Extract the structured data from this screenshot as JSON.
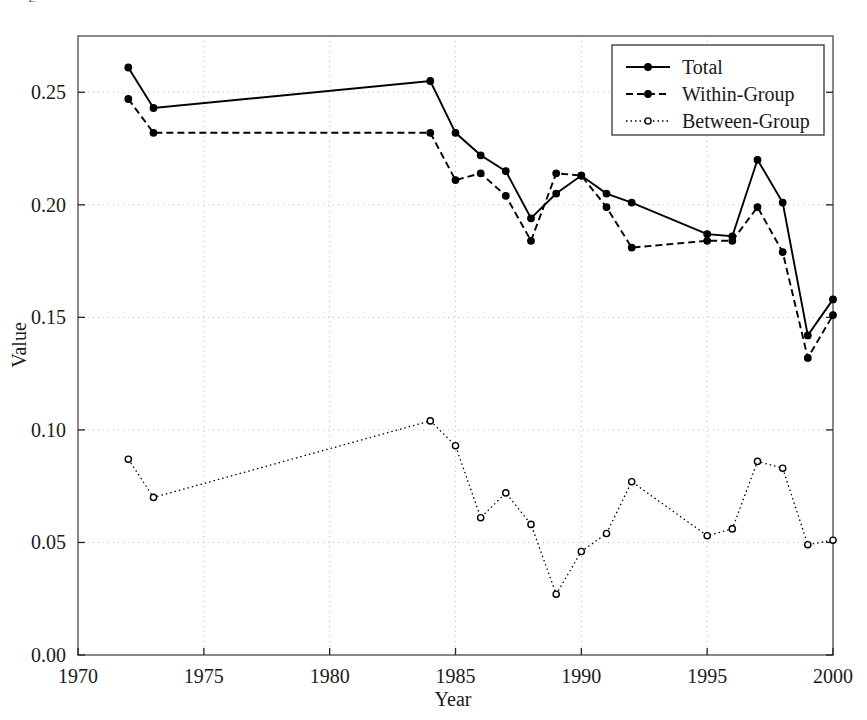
{
  "figure": {
    "partial_top_text": "g",
    "axis": {
      "xlabel": "Year",
      "ylabel": "Value",
      "xticks": [
        "1970",
        "1975",
        "1980",
        "1985",
        "1990",
        "1995",
        "2000"
      ],
      "yticks": [
        "0.00",
        "0.05",
        "0.10",
        "0.15",
        "0.20",
        "0.25"
      ],
      "xlim": [
        1970,
        2000
      ],
      "ylim": [
        0.0,
        0.275
      ]
    },
    "legend": {
      "entries": [
        "Total",
        "Within-Group",
        "Between-Group"
      ]
    },
    "colors": {
      "line": "#000000",
      "grid": "#bbbbbb",
      "frame": "#555555",
      "background": "#ffffff"
    }
  },
  "chart_data": {
    "type": "line",
    "title": "",
    "xlabel": "Year",
    "ylabel": "Value",
    "xlim": [
      1970,
      2000
    ],
    "ylim": [
      0.0,
      0.275
    ],
    "xticks": [
      1970,
      1975,
      1980,
      1985,
      1990,
      1995,
      2000
    ],
    "yticks": [
      0.0,
      0.05,
      0.1,
      0.15,
      0.2,
      0.25
    ],
    "grid": true,
    "legend_position": "top-right",
    "x": [
      1972,
      1973,
      1984,
      1985,
      1986,
      1987,
      1988,
      1989,
      1990,
      1991,
      1992,
      1993,
      1994,
      1995,
      1996,
      1997,
      1998,
      1999,
      2000
    ],
    "series": [
      {
        "name": "Total",
        "style": "solid",
        "marker": "filled-circle",
        "x": [
          1972,
          1973,
          1984,
          1985,
          1986,
          1987,
          1988,
          1989,
          1990,
          1991,
          1992,
          1995,
          1996,
          1997,
          1998,
          1999,
          2000
        ],
        "values": [
          0.261,
          0.243,
          0.255,
          0.232,
          0.222,
          0.215,
          0.194,
          0.205,
          0.213,
          0.205,
          0.201,
          0.187,
          0.186,
          0.22,
          0.201,
          0.142,
          0.158
        ]
      },
      {
        "name": "Within-Group",
        "style": "dashed",
        "marker": "filled-circle",
        "x": [
          1972,
          1973,
          1984,
          1985,
          1986,
          1987,
          1988,
          1989,
          1990,
          1991,
          1992,
          1995,
          1996,
          1997,
          1998,
          1999,
          2000
        ],
        "values": [
          0.247,
          0.232,
          0.232,
          0.211,
          0.214,
          0.204,
          0.184,
          0.214,
          0.213,
          0.199,
          0.181,
          0.184,
          0.184,
          0.199,
          0.179,
          0.132,
          0.151
        ]
      },
      {
        "name": "Between-Group",
        "style": "dotted",
        "marker": "open-circle",
        "x": [
          1972,
          1973,
          1984,
          1985,
          1986,
          1987,
          1988,
          1989,
          1990,
          1991,
          1992,
          1995,
          1996,
          1997,
          1998,
          1999,
          2000
        ],
        "values": [
          0.087,
          0.07,
          0.104,
          0.093,
          0.061,
          0.072,
          0.058,
          0.027,
          0.046,
          0.054,
          0.077,
          0.053,
          0.056,
          0.086,
          0.083,
          0.049,
          0.051
        ]
      }
    ]
  }
}
